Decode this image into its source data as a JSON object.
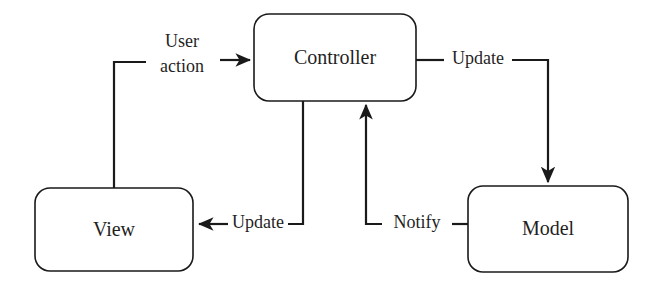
{
  "diagram": {
    "background_color": "#ffffff",
    "line_color": "#1a1a1a",
    "text_color": "#1f1f1f",
    "nodes": [
      {
        "id": "controller",
        "label": "Controller",
        "x": 254,
        "y": 14,
        "width": 162,
        "height": 87
      },
      {
        "id": "view",
        "label": "View",
        "x": 35,
        "y": 188,
        "width": 158,
        "height": 83
      },
      {
        "id": "model",
        "label": "Model",
        "x": 468,
        "y": 186,
        "width": 160,
        "height": 86
      }
    ],
    "edges": [
      {
        "id": "view-to-controller",
        "label_line1": "User",
        "label_line2": "action",
        "from": "view",
        "to": "controller",
        "arrow": "right"
      },
      {
        "id": "controller-to-model",
        "label": "Update",
        "from": "controller",
        "to": "model",
        "arrow": "down"
      },
      {
        "id": "controller-to-view",
        "label": "Update",
        "from": "controller",
        "to": "view",
        "arrow": "left"
      },
      {
        "id": "model-to-controller",
        "label": "Notify",
        "from": "model",
        "to": "controller",
        "arrow": "up"
      }
    ]
  }
}
